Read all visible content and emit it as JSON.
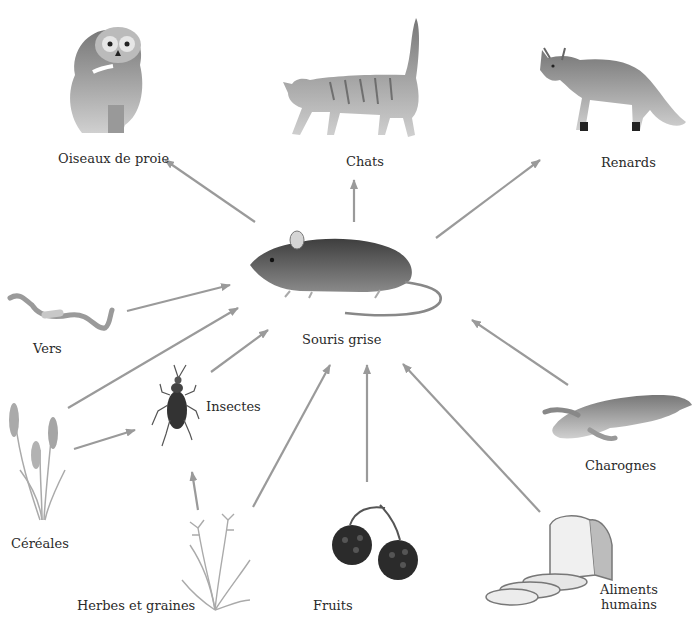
{
  "diagram": {
    "center": {
      "label": "Souris grise",
      "icon": "mouse-icon"
    },
    "predators": [
      {
        "label": "Oiseaux de proie",
        "icon": "owl-icon"
      },
      {
        "label": "Chats",
        "icon": "cat-icon"
      },
      {
        "label": "Renards",
        "icon": "fox-icon"
      }
    ],
    "food_sources": [
      {
        "label": "Vers",
        "icon": "worm-icon"
      },
      {
        "label": "Insectes",
        "icon": "beetle-icon"
      },
      {
        "label": "Céréales",
        "icon": "wheat-icon"
      },
      {
        "label": "Herbes et graines",
        "icon": "grass-icon"
      },
      {
        "label": "Fruits",
        "icon": "blackberry-icon"
      },
      {
        "label": "Charognes",
        "icon": "dead-rabbit-icon"
      },
      {
        "label": "Aliments humains",
        "label_line1": "Aliments",
        "label_line2": "humains",
        "icon": "bread-icon"
      }
    ],
    "arrow_color": "#9a9a9a"
  }
}
